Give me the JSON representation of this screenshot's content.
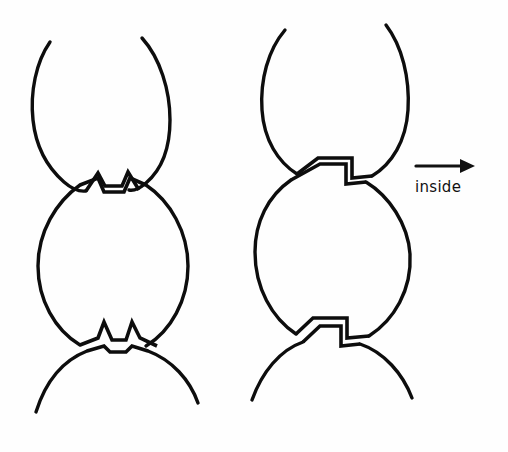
{
  "figure": {
    "background_color": "#fefefe",
    "ink_color": "#0d0d0d",
    "width": 508,
    "height": 452
  },
  "annotation": {
    "label": "inside",
    "arrow_direction": "right",
    "arrow_name": "inside-arrow"
  },
  "panels": [
    {
      "name": "left-panel",
      "description": "chain with zigzag V-notch junctions",
      "center_x": 118,
      "circles": [
        {
          "name": "top-partial-circle",
          "cx": 118,
          "cy": 120,
          "r": 72
        },
        {
          "name": "middle-circle",
          "cx": 118,
          "cy": 265,
          "r": 80
        },
        {
          "name": "bottom-partial-circle",
          "cx": 118,
          "cy": 420,
          "r": 78
        }
      ],
      "junctions": [
        {
          "name": "upper-junction",
          "type": "zigzag",
          "y": 182
        },
        {
          "name": "lower-junction",
          "type": "zigzag",
          "y": 340
        }
      ]
    },
    {
      "name": "right-panel",
      "description": "chain with staircase step junctions",
      "center_x": 335,
      "circles": [
        {
          "name": "top-partial-circle",
          "cx": 335,
          "cy": 110,
          "r": 70
        },
        {
          "name": "middle-circle",
          "cx": 333,
          "cy": 252,
          "r": 78
        },
        {
          "name": "bottom-partial-circle",
          "cx": 333,
          "cy": 408,
          "r": 78
        }
      ],
      "junctions": [
        {
          "name": "upper-junction",
          "type": "staircase",
          "y": 170
        },
        {
          "name": "lower-junction",
          "type": "staircase",
          "y": 330
        }
      ]
    }
  ]
}
